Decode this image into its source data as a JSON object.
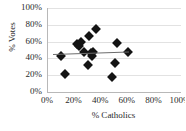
{
  "chart_data": {
    "type": "scatter",
    "title": "",
    "xlabel": "% Catholics",
    "ylabel": "% Votes",
    "xlim": [
      0,
      100
    ],
    "ylim": [
      0,
      100
    ],
    "grid": true,
    "legend": "none",
    "x_tick_labels": [
      "0%",
      "20%",
      "40%",
      "60%",
      "80%",
      "100%"
    ],
    "x_ticks": [
      0,
      20,
      40,
      60,
      80,
      100
    ],
    "y_tick_labels": [
      "0%",
      "20%",
      "40%",
      "60%",
      "80%",
      "100%"
    ],
    "y_ticks": [
      0,
      20,
      40,
      60,
      80,
      100
    ],
    "marker": "diamond",
    "marker_color": "#141414",
    "trendline_color": "#6d6d6d",
    "points": [
      {
        "x": 10,
        "y": 43
      },
      {
        "x": 13,
        "y": 22
      },
      {
        "x": 22,
        "y": 57
      },
      {
        "x": 23,
        "y": 55
      },
      {
        "x": 25,
        "y": 59
      },
      {
        "x": 27,
        "y": 48
      },
      {
        "x": 30,
        "y": 32
      },
      {
        "x": 31,
        "y": 67
      },
      {
        "x": 32,
        "y": 46
      },
      {
        "x": 33,
        "y": 43
      },
      {
        "x": 34,
        "y": 48
      },
      {
        "x": 36,
        "y": 75
      },
      {
        "x": 48,
        "y": 18
      },
      {
        "x": 50,
        "y": 35
      },
      {
        "x": 52,
        "y": 58
      },
      {
        "x": 60,
        "y": 48
      }
    ],
    "trendline": {
      "x0": 4,
      "y0": 45,
      "x1": 61,
      "y1": 48
    }
  }
}
